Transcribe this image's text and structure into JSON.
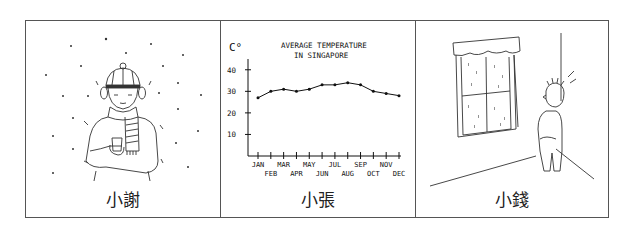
{
  "panels": [
    {
      "caption": "小謝",
      "scene": "person bundled in hat, earmuffs, scarf and coat, shivering in falling snow, holding a warm cup"
    },
    {
      "caption": "小張",
      "scene": "hand-drawn line chart of average temperature in Singapore"
    },
    {
      "caption": "小錢",
      "scene": "boy with arms crossed looking up at a rain-streaked window in a room corner"
    }
  ],
  "chart_data": {
    "type": "line",
    "title": "AVERAGE TEMPERATURE IN SINGAPORE",
    "title_line1": "AVERAGE TEMPERATURE",
    "title_line2": "IN SINGAPORE",
    "xlabel": "",
    "ylabel": "C°",
    "ylim": [
      0,
      45
    ],
    "yticks": [
      10,
      20,
      30,
      40
    ],
    "grid": false,
    "categories": [
      "JAN",
      "FEB",
      "MAR",
      "APR",
      "MAY",
      "JUN",
      "JUL",
      "AUG",
      "SEP",
      "OCT",
      "NOV",
      "DEC"
    ],
    "values": [
      27,
      30,
      31,
      30,
      31,
      33,
      33,
      34,
      33,
      30,
      29,
      28
    ]
  }
}
